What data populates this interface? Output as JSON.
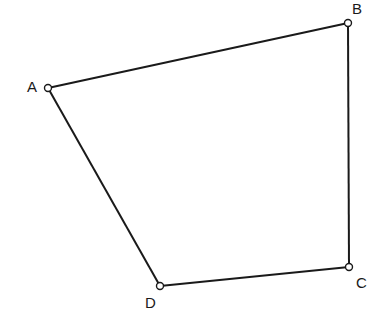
{
  "diagram": {
    "type": "quadrilateral",
    "vertices": [
      {
        "id": "A",
        "label": "A"
      },
      {
        "id": "B",
        "label": "B"
      },
      {
        "id": "C",
        "label": "C"
      },
      {
        "id": "D",
        "label": "D"
      }
    ],
    "edges": [
      [
        "A",
        "B"
      ],
      [
        "B",
        "C"
      ],
      [
        "C",
        "D"
      ],
      [
        "D",
        "A"
      ]
    ],
    "colors": {
      "stroke": "#1a1a1a",
      "vertex_fill": "#ffffff",
      "background": "#ffffff"
    }
  }
}
